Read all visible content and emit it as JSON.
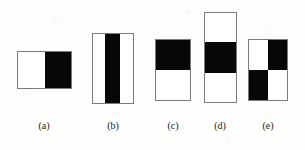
{
  "figure_panel": {
    "background_color": "#fdfdfc",
    "stroke_color": "#7b7b7b",
    "fill_dark": "#080808",
    "fill_light": "#ffffff",
    "panels": [
      {
        "id": "a",
        "caption": "(a)",
        "orientation": "horizontal",
        "layout": "two-column",
        "cells": [
          "white",
          "black"
        ]
      },
      {
        "id": "b",
        "caption": "(b)",
        "orientation": "horizontal",
        "layout": "three-column",
        "cells": [
          "white",
          "black",
          "white"
        ]
      },
      {
        "id": "c",
        "caption": "(c)",
        "orientation": "vertical",
        "layout": "two-row",
        "cells": [
          "black",
          "white"
        ]
      },
      {
        "id": "d",
        "caption": "(d)",
        "orientation": "vertical",
        "layout": "three-row",
        "cells": [
          "white",
          "black",
          "white"
        ]
      },
      {
        "id": "e",
        "caption": "(e)",
        "orientation": "checkerboard",
        "layout": "two-by-two",
        "cells": [
          "white",
          "black",
          "black",
          "white"
        ]
      }
    ]
  }
}
